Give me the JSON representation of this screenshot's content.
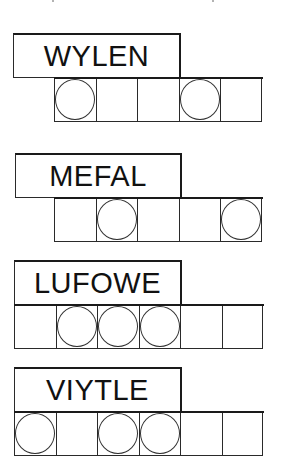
{
  "puzzles": [
    {
      "scrambled_word": "WYLEN",
      "letter_count": 5,
      "circled_positions": [
        1,
        4
      ],
      "cells": [
        {
          "index": 1,
          "circled": true
        },
        {
          "index": 2,
          "circled": false
        },
        {
          "index": 3,
          "circled": false
        },
        {
          "index": 4,
          "circled": true
        },
        {
          "index": 5,
          "circled": false
        }
      ]
    },
    {
      "scrambled_word": "MEFAL",
      "letter_count": 5,
      "circled_positions": [
        2,
        5
      ],
      "cells": [
        {
          "index": 1,
          "circled": false
        },
        {
          "index": 2,
          "circled": true
        },
        {
          "index": 3,
          "circled": false
        },
        {
          "index": 4,
          "circled": false
        },
        {
          "index": 5,
          "circled": true
        }
      ]
    },
    {
      "scrambled_word": "LUFOWE",
      "letter_count": 6,
      "circled_positions": [
        2,
        3,
        4
      ],
      "cells": [
        {
          "index": 1,
          "circled": false
        },
        {
          "index": 2,
          "circled": true
        },
        {
          "index": 3,
          "circled": true
        },
        {
          "index": 4,
          "circled": true
        },
        {
          "index": 5,
          "circled": false
        },
        {
          "index": 6,
          "circled": false
        }
      ]
    },
    {
      "scrambled_word": "VIYTLE",
      "letter_count": 6,
      "circled_positions": [
        1,
        3,
        4
      ],
      "cells": [
        {
          "index": 1,
          "circled": true
        },
        {
          "index": 2,
          "circled": false
        },
        {
          "index": 3,
          "circled": true
        },
        {
          "index": 4,
          "circled": true
        },
        {
          "index": 5,
          "circled": false
        },
        {
          "index": 6,
          "circled": false
        }
      ]
    }
  ],
  "colors": {
    "background": "#ffffff",
    "ink": "#111111",
    "border": "#1a1a1a"
  }
}
